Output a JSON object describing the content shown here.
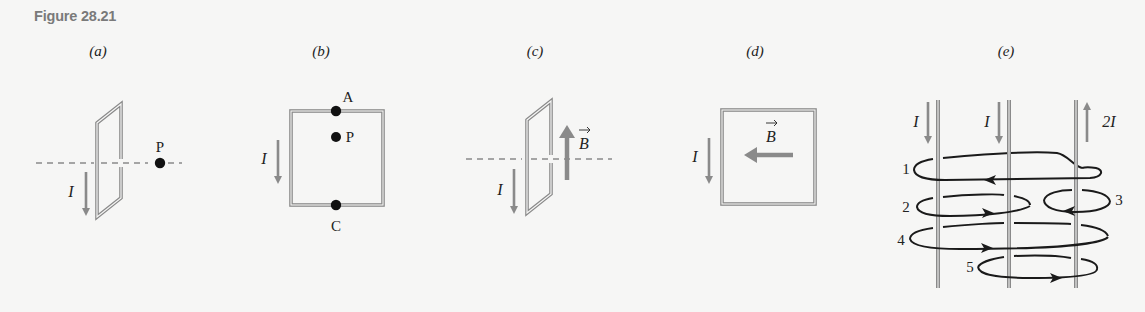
{
  "figure": {
    "title": "Figure 28.21",
    "colors": {
      "background": "#f6f6f5",
      "wire": "#8a8a8a",
      "wire_inner": "#f6f6f5",
      "arrow": "#8a8a8a",
      "loop": "#1a1a1a",
      "text": "#222222",
      "title": "#7a7a7a"
    },
    "panels": [
      {
        "id": "a",
        "label": "(a)",
        "current_label": "I",
        "point_label": "P"
      },
      {
        "id": "b",
        "label": "(b)",
        "current_label": "I",
        "point_labels": [
          "A",
          "P",
          "C"
        ]
      },
      {
        "id": "c",
        "label": "(c)",
        "current_label": "I",
        "field_label": "B"
      },
      {
        "id": "d",
        "label": "(d)",
        "current_label": "I",
        "field_label": "B"
      },
      {
        "id": "e",
        "label": "(e)",
        "current_labels": [
          "I",
          "I",
          "2I"
        ],
        "loop_labels": [
          "1",
          "2",
          "3",
          "4",
          "5"
        ]
      }
    ]
  }
}
